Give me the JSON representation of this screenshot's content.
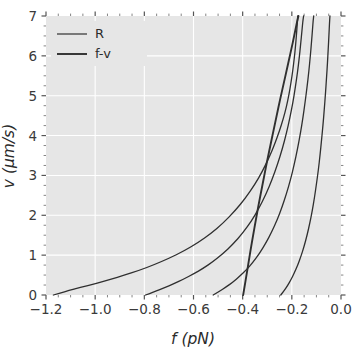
{
  "chart_data": {
    "type": "line",
    "title": "",
    "xlabel": "f (pN)",
    "ylabel": "v (µm/s)",
    "xlim": [
      -1.2,
      0.0
    ],
    "ylim": [
      0,
      7
    ],
    "xticks": [
      -1.2,
      -1.0,
      -0.8,
      -0.6,
      -0.4,
      -0.2,
      0.0
    ],
    "xticklabels": [
      "−1.2",
      "−1.0",
      "−0.8",
      "−0.6",
      "−0.4",
      "−0.2",
      "0.0"
    ],
    "yticks": [
      0,
      1,
      2,
      3,
      4,
      5,
      6,
      7
    ],
    "yticklabels": [
      "0",
      "1",
      "2",
      "3",
      "4",
      "5",
      "6",
      "7"
    ],
    "grid": true,
    "grid_color": "#ffffff",
    "axes_facecolor": "#e6e6e6",
    "figure_facecolor": "#ffffff",
    "legend_position": "upper left",
    "legend_entries": [
      {
        "label": "R",
        "color": "#2f2f2f",
        "linewidth": 1.2
      },
      {
        "label": "f-v",
        "color": "#2f2f2f",
        "linewidth": 1.9
      }
    ],
    "series": [
      {
        "name": "R",
        "kind": "R",
        "color": "#2f2f2f",
        "linewidth": 1.3,
        "points": [
          [
            -1.17,
            0.0
          ],
          [
            -1.12,
            0.09
          ],
          [
            -1.06,
            0.19
          ],
          [
            -1.0,
            0.28
          ],
          [
            -0.94,
            0.39
          ],
          [
            -0.88,
            0.5
          ],
          [
            -0.82,
            0.62
          ],
          [
            -0.76,
            0.76
          ],
          [
            -0.7,
            0.92
          ],
          [
            -0.64,
            1.1
          ],
          [
            -0.58,
            1.32
          ],
          [
            -0.53,
            1.54
          ],
          [
            -0.48,
            1.8
          ],
          [
            -0.43,
            2.12
          ],
          [
            -0.39,
            2.42
          ],
          [
            -0.35,
            2.78
          ],
          [
            -0.32,
            3.1
          ],
          [
            -0.29,
            3.48
          ],
          [
            -0.27,
            3.78
          ],
          [
            -0.25,
            4.12
          ],
          [
            -0.235,
            4.42
          ],
          [
            -0.222,
            4.72
          ],
          [
            -0.212,
            5.02
          ],
          [
            -0.203,
            5.34
          ],
          [
            -0.196,
            5.64
          ],
          [
            -0.19,
            5.94
          ],
          [
            -0.185,
            6.24
          ],
          [
            -0.181,
            6.54
          ],
          [
            -0.178,
            6.8
          ],
          [
            -0.176,
            7.0
          ]
        ]
      },
      {
        "name": "R",
        "kind": "R",
        "color": "#2f2f2f",
        "linewidth": 1.3,
        "points": [
          [
            -0.795,
            0.0
          ],
          [
            -0.76,
            0.08
          ],
          [
            -0.72,
            0.18
          ],
          [
            -0.68,
            0.28
          ],
          [
            -0.64,
            0.4
          ],
          [
            -0.6,
            0.53
          ],
          [
            -0.56,
            0.67
          ],
          [
            -0.52,
            0.84
          ],
          [
            -0.48,
            1.04
          ],
          [
            -0.44,
            1.27
          ],
          [
            -0.4,
            1.55
          ],
          [
            -0.365,
            1.85
          ],
          [
            -0.335,
            2.16
          ],
          [
            -0.305,
            2.53
          ],
          [
            -0.28,
            2.9
          ],
          [
            -0.258,
            3.28
          ],
          [
            -0.238,
            3.68
          ],
          [
            -0.222,
            4.06
          ],
          [
            -0.208,
            4.44
          ],
          [
            -0.196,
            4.82
          ],
          [
            -0.186,
            5.2
          ],
          [
            -0.177,
            5.58
          ],
          [
            -0.17,
            5.94
          ],
          [
            -0.164,
            6.3
          ],
          [
            -0.159,
            6.62
          ],
          [
            -0.155,
            6.88
          ],
          [
            -0.152,
            7.0
          ]
        ]
      },
      {
        "name": "R",
        "kind": "R",
        "color": "#2f2f2f",
        "linewidth": 1.3,
        "points": [
          [
            -0.52,
            0.0
          ],
          [
            -0.495,
            0.09
          ],
          [
            -0.468,
            0.2
          ],
          [
            -0.44,
            0.32
          ],
          [
            -0.412,
            0.47
          ],
          [
            -0.385,
            0.63
          ],
          [
            -0.358,
            0.82
          ],
          [
            -0.332,
            1.04
          ],
          [
            -0.306,
            1.3
          ],
          [
            -0.282,
            1.58
          ],
          [
            -0.26,
            1.88
          ],
          [
            -0.24,
            2.2
          ],
          [
            -0.222,
            2.54
          ],
          [
            -0.205,
            2.9
          ],
          [
            -0.19,
            3.28
          ],
          [
            -0.177,
            3.66
          ],
          [
            -0.165,
            4.06
          ],
          [
            -0.155,
            4.44
          ],
          [
            -0.146,
            4.84
          ],
          [
            -0.138,
            5.22
          ],
          [
            -0.131,
            5.6
          ],
          [
            -0.125,
            5.98
          ],
          [
            -0.12,
            6.34
          ],
          [
            -0.116,
            6.66
          ],
          [
            -0.113,
            6.9
          ],
          [
            -0.111,
            7.0
          ]
        ]
      },
      {
        "name": "R",
        "kind": "R",
        "color": "#2f2f2f",
        "linewidth": 1.3,
        "points": [
          [
            -0.245,
            0.0
          ],
          [
            -0.232,
            0.1
          ],
          [
            -0.218,
            0.23
          ],
          [
            -0.204,
            0.38
          ],
          [
            -0.19,
            0.55
          ],
          [
            -0.176,
            0.75
          ],
          [
            -0.163,
            0.97
          ],
          [
            -0.15,
            1.22
          ],
          [
            -0.138,
            1.5
          ],
          [
            -0.127,
            1.8
          ],
          [
            -0.117,
            2.11
          ],
          [
            -0.108,
            2.44
          ],
          [
            -0.1,
            2.78
          ],
          [
            -0.092,
            3.14
          ],
          [
            -0.085,
            3.52
          ],
          [
            -0.079,
            3.9
          ],
          [
            -0.073,
            4.28
          ],
          [
            -0.068,
            4.66
          ],
          [
            -0.063,
            5.06
          ],
          [
            -0.059,
            5.44
          ],
          [
            -0.055,
            5.82
          ],
          [
            -0.052,
            6.18
          ],
          [
            -0.049,
            6.52
          ],
          [
            -0.047,
            6.8
          ],
          [
            -0.045,
            7.0
          ]
        ]
      },
      {
        "name": "f-v",
        "kind": "f-v",
        "color": "#2f2f2f",
        "linewidth": 1.9,
        "points": [
          [
            -0.398,
            0.0
          ],
          [
            -0.392,
            0.22
          ],
          [
            -0.385,
            0.48
          ],
          [
            -0.377,
            0.78
          ],
          [
            -0.368,
            1.12
          ],
          [
            -0.358,
            1.48
          ],
          [
            -0.347,
            1.86
          ],
          [
            -0.336,
            2.24
          ],
          [
            -0.324,
            2.62
          ],
          [
            -0.312,
            3.0
          ],
          [
            -0.3,
            3.38
          ],
          [
            -0.287,
            3.76
          ],
          [
            -0.274,
            4.14
          ],
          [
            -0.261,
            4.52
          ],
          [
            -0.248,
            4.9
          ],
          [
            -0.234,
            5.28
          ],
          [
            -0.221,
            5.64
          ],
          [
            -0.208,
            6.0
          ],
          [
            -0.196,
            6.34
          ],
          [
            -0.186,
            6.64
          ],
          [
            -0.178,
            6.88
          ],
          [
            -0.173,
            7.0
          ]
        ]
      }
    ]
  },
  "axes": {
    "xlabel": "f (pN)",
    "ylabel": "v (µm/s)"
  },
  "legend": {
    "items": [
      {
        "label": "R"
      },
      {
        "label": "f-v"
      }
    ]
  }
}
